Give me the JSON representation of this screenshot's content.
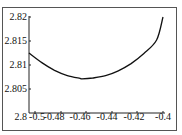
{
  "chart_data": {
    "type": "line",
    "title": "",
    "xlabel": "",
    "ylabel": "",
    "xlim": [
      -0.505,
      -0.4
    ],
    "ylim": [
      2.8,
      2.82
    ],
    "grid": false,
    "legend": null,
    "x_ticks": [
      "-0.5",
      "-0.48",
      "-0.46",
      "-0.44",
      "-0.42",
      "-0.4"
    ],
    "y_ticks": [
      "2.8",
      "2.805",
      "2.81",
      "2.815",
      "2.82"
    ],
    "series": [
      {
        "name": "curve",
        "x": [
          -0.505,
          -0.495,
          -0.485,
          -0.475,
          -0.465,
          -0.4635,
          -0.455,
          -0.445,
          -0.435,
          -0.425,
          -0.415,
          -0.405,
          -0.4
        ],
        "y": [
          2.8125,
          2.8105,
          2.8089,
          2.8078,
          2.8072,
          2.8071,
          2.8073,
          2.8078,
          2.8088,
          2.8103,
          2.8124,
          2.8152,
          2.82
        ]
      }
    ]
  },
  "labels": {
    "x": [
      "-0.5",
      "-0.48",
      "-0.46",
      "-0.44",
      "-0.42",
      "-0.4"
    ],
    "y": [
      "2.82",
      "2.815",
      "2.81",
      "2.805",
      "2.8"
    ]
  }
}
